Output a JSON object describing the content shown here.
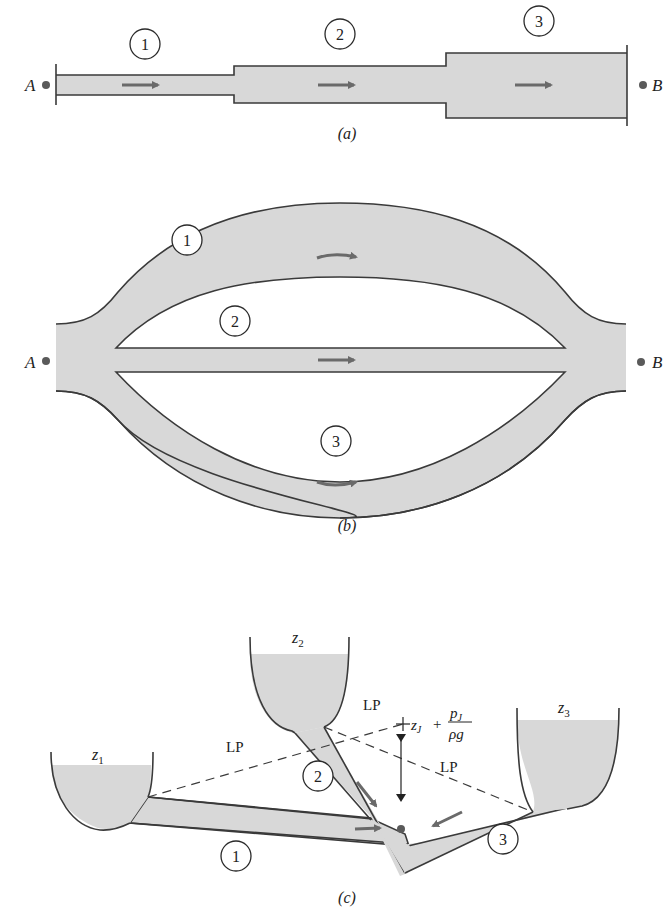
{
  "figure_a": {
    "caption": "(a)",
    "endpoint_left": "A",
    "endpoint_right": "B",
    "pipes": [
      {
        "label": "1"
      },
      {
        "label": "2"
      },
      {
        "label": "3"
      }
    ],
    "description": "Pipes in series"
  },
  "figure_b": {
    "caption": "(b)",
    "endpoint_left": "A",
    "endpoint_right": "B",
    "pipes": [
      {
        "label": "1"
      },
      {
        "label": "2"
      },
      {
        "label": "3"
      }
    ],
    "description": "Pipes in parallel"
  },
  "figure_c": {
    "caption": "(c)",
    "reservoirs": [
      {
        "label": "z",
        "sub": "1"
      },
      {
        "label": "z",
        "sub": "2"
      },
      {
        "label": "z",
        "sub": "3"
      }
    ],
    "pipes": [
      {
        "label": "1"
      },
      {
        "label": "2"
      },
      {
        "label": "3"
      }
    ],
    "lp_labels": [
      "LP",
      "LP",
      "LP"
    ],
    "junction_head": {
      "z": "z",
      "z_sub": "J",
      "plus": "+",
      "p": "p",
      "p_sub": "J",
      "denominator": "ρg"
    },
    "description": "Three-reservoir junction"
  },
  "colors": {
    "fluid": "#d8d8d8",
    "outline": "#3a3a3a",
    "arrow": "#6a6a6a"
  }
}
